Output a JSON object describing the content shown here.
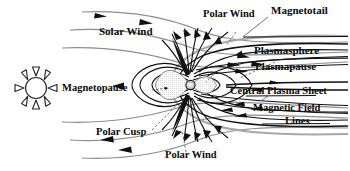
{
  "figure": {
    "background_color": "#ffffff",
    "line_color": "#111111",
    "flow_color": "#8d8d8d",
    "text_color": "#0a0a0a"
  },
  "labels": {
    "solar_wind": "Solar Wind",
    "polar_wind_top": "Polar Wind",
    "magnetotail": "Magnetotail",
    "plasmasphere": "Plasmasphere",
    "plasmapause": "Plasmapause",
    "central_plasma_sheet": "Central Plasma Sheet",
    "magnetic_field_lines_1": "Magnetic Field",
    "magnetic_field_lines_2": "Lines",
    "magnetopause": "Magnetopause",
    "polar_cusp": "Polar Cusp",
    "polar_wind_bottom": "Polar Wind"
  },
  "icons": {
    "sun": "sun-icon",
    "earth": "earth-icon"
  }
}
